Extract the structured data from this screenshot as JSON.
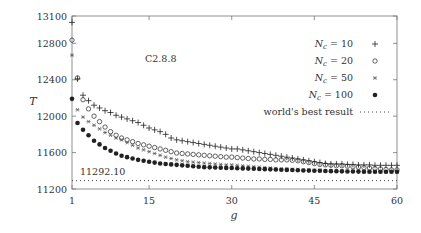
{
  "chart_data": {
    "type": "scatter",
    "title": "C2.8.8",
    "xlabel": "g",
    "ylabel": "T",
    "xlim": [
      1,
      60
    ],
    "ylim": [
      11200,
      13100
    ],
    "x_ticks": [
      1,
      15,
      30,
      45,
      60
    ],
    "y_ticks": [
      11200,
      11600,
      12000,
      12400,
      12800,
      13100
    ],
    "grid": false,
    "legend_position": "upper right (inside)",
    "reference_line": {
      "label": "world's best result",
      "value": 11292.1,
      "annotation": "11292.10",
      "style": "dotted"
    },
    "series": [
      {
        "name": "N_c = 10",
        "label_var": "N",
        "label_sub": "c",
        "label_val": "= 10",
        "marker": "plus",
        "x": [
          1,
          2,
          3,
          4,
          5,
          6,
          7,
          8,
          9,
          10,
          11,
          12,
          13,
          14,
          15,
          16,
          17,
          18,
          19,
          20,
          21,
          22,
          23,
          24,
          25,
          26,
          27,
          28,
          29,
          30,
          31,
          32,
          33,
          34,
          35,
          36,
          37,
          38,
          39,
          40,
          41,
          42,
          43,
          44,
          45,
          46,
          47,
          48,
          49,
          50,
          51,
          52,
          53,
          54,
          55,
          56,
          57,
          58,
          59,
          60
        ],
        "values": [
          13030,
          12410,
          12230,
          12170,
          12120,
          12090,
          12060,
          12040,
          12010,
          11990,
          11970,
          11950,
          11930,
          11900,
          11870,
          11850,
          11830,
          11800,
          11760,
          11740,
          11730,
          11720,
          11710,
          11700,
          11690,
          11680,
          11670,
          11660,
          11650,
          11640,
          11640,
          11630,
          11620,
          11610,
          11600,
          11590,
          11580,
          11570,
          11560,
          11550,
          11540,
          11530,
          11520,
          11510,
          11500,
          11490,
          11480,
          11475,
          11475,
          11475,
          11470,
          11470,
          11465,
          11465,
          11465,
          11460,
          11460,
          11460,
          11460,
          11460
        ]
      },
      {
        "name": "N_c = 20",
        "label_var": "N",
        "label_sub": "c",
        "label_val": "= 20",
        "marker": "circle-open",
        "x": [
          1,
          2,
          3,
          4,
          5,
          6,
          7,
          8,
          9,
          10,
          11,
          12,
          13,
          14,
          15,
          16,
          17,
          18,
          19,
          20,
          21,
          22,
          23,
          24,
          25,
          26,
          27,
          28,
          29,
          30,
          31,
          32,
          33,
          34,
          35,
          36,
          37,
          38,
          39,
          40,
          41,
          42,
          43,
          44,
          45,
          46,
          47,
          48,
          49,
          50,
          51,
          52,
          53,
          54,
          55,
          56,
          57,
          58,
          59,
          60
        ],
        "values": [
          12835,
          12420,
          12180,
          12080,
          12000,
          11940,
          11880,
          11830,
          11790,
          11760,
          11740,
          11720,
          11700,
          11685,
          11670,
          11655,
          11640,
          11625,
          11610,
          11595,
          11590,
          11585,
          11580,
          11575,
          11570,
          11565,
          11560,
          11555,
          11550,
          11550,
          11545,
          11540,
          11535,
          11530,
          11530,
          11525,
          11525,
          11520,
          11520,
          11520,
          11515,
          11510,
          11500,
          11490,
          11480,
          11470,
          11465,
          11460,
          11455,
          11455,
          11450,
          11445,
          11440,
          11435,
          11430,
          11425,
          11420,
          11415,
          11410,
          11410
        ]
      },
      {
        "name": "N_c = 50",
        "label_var": "N",
        "label_sub": "c",
        "label_val": "= 50",
        "marker": "asterisk",
        "x": [
          1,
          2,
          3,
          4,
          5,
          6,
          7,
          8,
          9,
          10,
          11,
          12,
          13,
          14,
          15,
          16,
          17,
          18,
          19,
          20,
          21,
          22,
          23,
          24,
          25,
          26,
          27,
          28,
          29,
          30,
          31,
          32,
          33,
          34,
          35,
          36,
          37,
          38,
          39,
          40,
          41,
          42,
          43,
          44,
          45,
          46,
          47,
          48,
          49,
          50,
          51,
          52,
          53,
          54,
          55,
          56,
          57,
          58,
          59,
          60
        ],
        "values": [
          12670,
          12070,
          11990,
          11940,
          11900,
          11860,
          11820,
          11790,
          11760,
          11740,
          11710,
          11680,
          11650,
          11630,
          11610,
          11590,
          11570,
          11550,
          11535,
          11520,
          11510,
          11500,
          11495,
          11490,
          11485,
          11480,
          11475,
          11470,
          11465,
          11465,
          11460,
          11455,
          11450,
          11445,
          11440,
          11435,
          11430,
          11425,
          11420,
          11420,
          11415,
          11415,
          11410,
          11410,
          11405,
          11405,
          11400,
          11400,
          11400,
          11395,
          11395,
          11395,
          11395,
          11390,
          11390,
          11390,
          11390,
          11390,
          11390,
          11390
        ]
      },
      {
        "name": "N_c = 100",
        "label_var": "N",
        "label_sub": "c",
        "label_val": "= 100",
        "marker": "circle-filled",
        "x": [
          1,
          2,
          3,
          4,
          5,
          6,
          7,
          8,
          9,
          10,
          11,
          12,
          13,
          14,
          15,
          16,
          17,
          18,
          19,
          20,
          21,
          22,
          23,
          24,
          25,
          26,
          27,
          28,
          29,
          30,
          31,
          32,
          33,
          34,
          35,
          36,
          37,
          38,
          39,
          40,
          41,
          42,
          43,
          44,
          45,
          46,
          47,
          48,
          49,
          50,
          51,
          52,
          53,
          54,
          55,
          56,
          57,
          58,
          59,
          60
        ],
        "values": [
          12190,
          11925,
          11850,
          11790,
          11730,
          11690,
          11650,
          11620,
          11590,
          11565,
          11550,
          11535,
          11520,
          11510,
          11500,
          11490,
          11480,
          11475,
          11470,
          11465,
          11460,
          11455,
          11450,
          11445,
          11440,
          11438,
          11436,
          11434,
          11432,
          11430,
          11428,
          11426,
          11424,
          11422,
          11420,
          11418,
          11416,
          11414,
          11412,
          11410,
          11408,
          11406,
          11404,
          11402,
          11400,
          11400,
          11398,
          11396,
          11395,
          11394,
          11393,
          11392,
          11391,
          11390,
          11390,
          11390,
          11390,
          11390,
          11390,
          11390
        ]
      }
    ]
  },
  "legend": {
    "entries": [
      {
        "var": "N",
        "sub": "c",
        "val": " = 10"
      },
      {
        "var": "N",
        "sub": "c",
        "val": " = 20"
      },
      {
        "var": "N",
        "sub": "c",
        "val": " = 50"
      },
      {
        "var": "N",
        "sub": "c",
        "val": " = 100"
      }
    ],
    "reference_label": "world's best result"
  },
  "colors": {
    "axis": "#555555",
    "marker": "#222222",
    "text": "#333333",
    "background": "#ffffff"
  }
}
